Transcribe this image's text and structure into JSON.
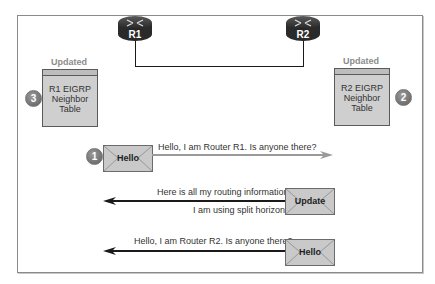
{
  "routers": [
    {
      "id": "r1",
      "label": "R1"
    },
    {
      "id": "r2",
      "label": "R2"
    }
  ],
  "tables": {
    "r1": {
      "status": "Updated",
      "lines": [
        "R1 EIGRP",
        "Neighbor",
        "Table"
      ],
      "step": "3"
    },
    "r2": {
      "status": "Updated",
      "lines": [
        "R2 EIGRP",
        "Neighbor",
        "Table"
      ],
      "step": "2"
    }
  },
  "messages": [
    {
      "step": "1",
      "packet": "Hello",
      "text": "Hello, I am Router R1. Is anyone there?",
      "direction": "right",
      "arrow_color": "#9a9a9a"
    },
    {
      "packet": "Update",
      "text_above": "Here is all my routing information.",
      "text_below": "I am using split horizon.",
      "direction": "left",
      "arrow_color": "#1a1a1a"
    },
    {
      "packet": "Hello",
      "text": "Hello, I am Router R2. Is anyone there?",
      "direction": "left",
      "arrow_color": "#1a1a1a"
    }
  ]
}
